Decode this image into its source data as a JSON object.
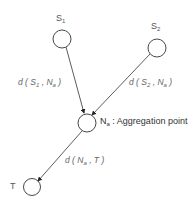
{
  "nodes": {
    "s1": {
      "name": "S",
      "sub": "1"
    },
    "s2": {
      "name": "S",
      "sub": "2"
    },
    "na": {
      "name": "N",
      "sub": "a",
      "desc": " : Aggregation point"
    },
    "t": {
      "name": "T"
    }
  },
  "edges": {
    "s1_na": {
      "prefix": "d ( S",
      "sub1": "1",
      "mid": " , N",
      "sub2": "a",
      "suffix": " )"
    },
    "s2_na": {
      "prefix": "d ( S",
      "sub1": "2",
      "mid": " , N",
      "sub2": "a",
      "suffix": " )"
    },
    "na_t": {
      "prefix": "d ( N",
      "sub1": "a",
      "mid": " , T",
      "suffix": " )"
    }
  },
  "colors": {
    "stroke": "#333333",
    "text": "#555555"
  }
}
